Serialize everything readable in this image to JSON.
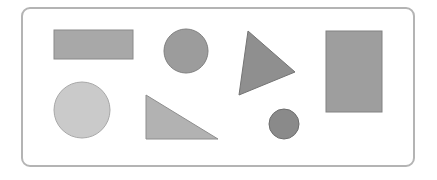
{
  "diagram": {
    "background": "#ffffff",
    "frame": {
      "x": 22,
      "y": 8,
      "width": 392,
      "height": 158,
      "rx": 8,
      "stroke": "#b4b4b4",
      "stroke_width": 2,
      "fill": "#ffffff"
    },
    "shapes": [
      {
        "type": "rect",
        "name": "wide-rectangle",
        "x": 54,
        "y": 30,
        "width": 79,
        "height": 29,
        "fill": "#a8a8a8",
        "stroke": "#8a8a8a"
      },
      {
        "type": "circle",
        "name": "medium-circle",
        "cx": 186,
        "cy": 51,
        "r": 22,
        "fill": "#9c9c9c",
        "stroke": "#808080"
      },
      {
        "type": "polygon",
        "name": "pointed-triangle",
        "points": "248,31 295,72 239,95",
        "fill": "#8f8f8f",
        "stroke": "#747474"
      },
      {
        "type": "rect",
        "name": "tall-rectangle",
        "x": 326,
        "y": 31,
        "width": 56,
        "height": 81,
        "fill": "#9e9e9e",
        "stroke": "#828282"
      },
      {
        "type": "circle",
        "name": "large-circle",
        "cx": 82,
        "cy": 110,
        "r": 28,
        "fill": "#cacaca",
        "stroke": "#a8a8a8"
      },
      {
        "type": "polygon",
        "name": "right-triangle",
        "points": "146,95 146,139 218,139",
        "fill": "#b2b2b2",
        "stroke": "#8e8e8e"
      },
      {
        "type": "circle",
        "name": "small-circle",
        "cx": 284,
        "cy": 124,
        "r": 15,
        "fill": "#8a8a8a",
        "stroke": "#6e6e6e"
      }
    ]
  }
}
